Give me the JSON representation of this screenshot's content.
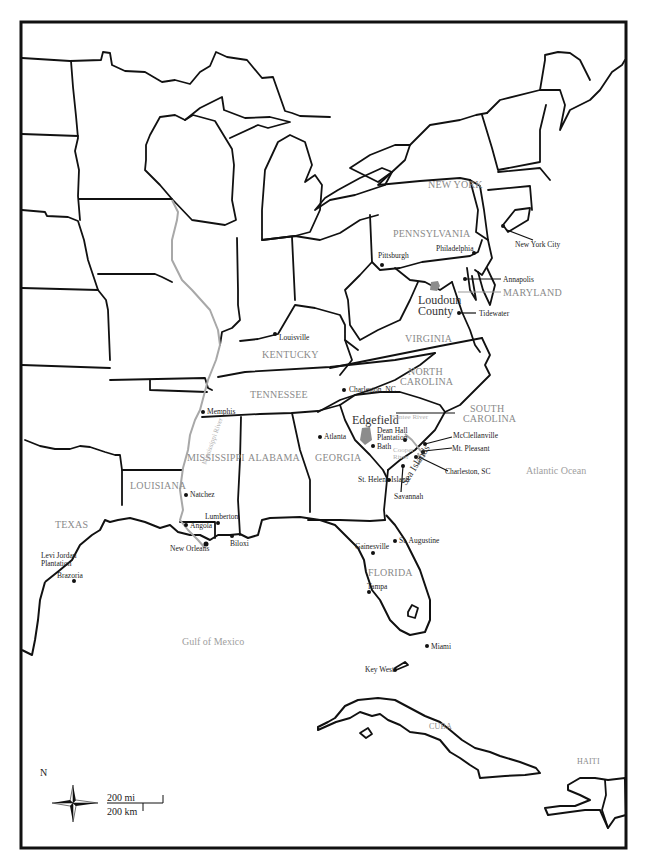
{
  "map": {
    "title": "Eastern United States and Caribbean",
    "states": [
      {
        "id": "new-york",
        "label": "NEW YORK"
      },
      {
        "id": "pennsylvania",
        "label": "PENNSYLVANIA"
      },
      {
        "id": "maryland",
        "label": "MARYLAND"
      },
      {
        "id": "virginia",
        "label": "VIRGINIA"
      },
      {
        "id": "kentucky",
        "label": "KENTUCKY"
      },
      {
        "id": "tennessee",
        "label": "TENNESSEE"
      },
      {
        "id": "north-carolina-1",
        "label": "NORTH"
      },
      {
        "id": "north-carolina-2",
        "label": "CAROLINA"
      },
      {
        "id": "south-carolina-1",
        "label": "SOUTH"
      },
      {
        "id": "south-carolina-2",
        "label": "CAROLINA"
      },
      {
        "id": "mississippi",
        "label": "MISSISSIPPI"
      },
      {
        "id": "alabama",
        "label": "ALABAMA"
      },
      {
        "id": "georgia",
        "label": "GEORGIA"
      },
      {
        "id": "louisiana",
        "label": "LOUISIANA"
      },
      {
        "id": "texas",
        "label": "TEXAS"
      },
      {
        "id": "florida",
        "label": "FLORIDA"
      },
      {
        "id": "cuba",
        "label": "CUBA"
      },
      {
        "id": "haiti",
        "label": "HAITI"
      }
    ],
    "cities": [
      {
        "id": "new-york-city",
        "label": "New York City"
      },
      {
        "id": "philadelphia",
        "label": "Philadelphia"
      },
      {
        "id": "pittsburgh",
        "label": "Pittsburgh"
      },
      {
        "id": "annapolis",
        "label": "Annapolis"
      },
      {
        "id": "tidewater",
        "label": "Tidewater"
      },
      {
        "id": "louisville",
        "label": "Louisville"
      },
      {
        "id": "charleston-nc",
        "label": "Charleston, NC"
      },
      {
        "id": "memphis",
        "label": "Memphis"
      },
      {
        "id": "atlanta",
        "label": "Atlanta"
      },
      {
        "id": "bath",
        "label": "Bath"
      },
      {
        "id": "dean-hall-1",
        "label": "Dean Hall"
      },
      {
        "id": "dean-hall-2",
        "label": "Plantation"
      },
      {
        "id": "mcclellanville",
        "label": "McClellanville"
      },
      {
        "id": "mt-pleasant",
        "label": "Mt. Pleasant"
      },
      {
        "id": "charleston-sc",
        "label": "Charleston, SC"
      },
      {
        "id": "savannah",
        "label": "Savannah"
      },
      {
        "id": "st-helena-island",
        "label": "St. Helena Island"
      },
      {
        "id": "natchez",
        "label": "Natchez"
      },
      {
        "id": "lumberton",
        "label": "Lumberton"
      },
      {
        "id": "angola",
        "label": "Angola"
      },
      {
        "id": "new-orleans",
        "label": "New Orleans"
      },
      {
        "id": "biloxi",
        "label": "Biloxi"
      },
      {
        "id": "levi-jordan-1",
        "label": "Levi Jordan"
      },
      {
        "id": "levi-jordan-2",
        "label": "Plantation"
      },
      {
        "id": "brazoria",
        "label": "Brazoria"
      },
      {
        "id": "gainesville",
        "label": "Gainesville"
      },
      {
        "id": "st-augustine",
        "label": "St. Augustine"
      },
      {
        "id": "tampa",
        "label": "Tampa"
      },
      {
        "id": "miami",
        "label": "Miami"
      },
      {
        "id": "key-west",
        "label": "Key West"
      }
    ],
    "highlights": {
      "loudoun_1": "Loudoun",
      "loudoun_2": "County",
      "edgefield": "Edgefield",
      "sea_islands": "Sea Islands"
    },
    "rivers": {
      "mississippi": "Mississippi River",
      "santee": "Santee River",
      "cooper_1": "Cooper",
      "cooper_2": "River"
    },
    "water": {
      "atlantic": "Atlantic Ocean",
      "gulf": "Gulf of Mexico"
    },
    "compass": {
      "north": "N"
    },
    "scale": {
      "miles": "200 mi",
      "km": "200 km"
    },
    "colors": {
      "border": "#111111",
      "river": "#a8a8a8",
      "state_label": "#8a8a8a",
      "highlight_area": "#8c8c8c"
    }
  }
}
